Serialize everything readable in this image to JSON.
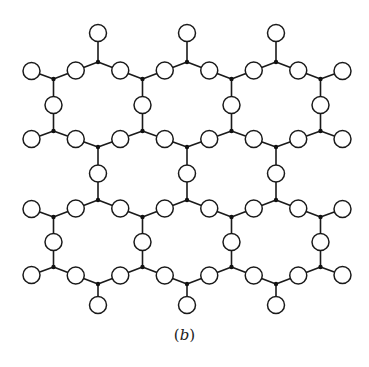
{
  "figure": {
    "caption_label": "b",
    "caption_open": "(",
    "caption_close": ")",
    "colors": {
      "line": "#1a1a1a",
      "oxygen_fill": "#ffffff",
      "node_fill": "#111111",
      "background": "#ffffff"
    },
    "geometry": {
      "hex_centers_x": [
        98,
        187,
        276
      ],
      "half_width": 44.5,
      "rows": [
        {
          "top": 62,
          "upper": 79,
          "lower": 131,
          "bottom": 147
        },
        {
          "top": 200,
          "upper": 217,
          "lower": 267,
          "bottom": 284
        }
      ],
      "oxygen_radius": 8.5,
      "node_radius": 2.2,
      "terminal_length": 29,
      "outer_terminal_dx": 22,
      "outer_terminal_dy": 8
    }
  }
}
